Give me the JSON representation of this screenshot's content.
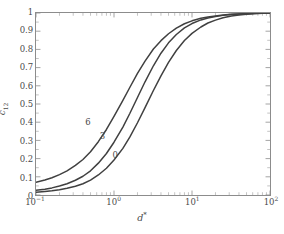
{
  "chart_data": {
    "type": "line",
    "title": "",
    "subtitle": "",
    "xlabel": "d*",
    "ylabel": "c12",
    "xscale": "log",
    "yscale": "linear",
    "xlim": [
      0.1,
      100
    ],
    "ylim": [
      0,
      1
    ],
    "grid": false,
    "legend_position": "inline-curve-labels",
    "xticks": [
      "10⁻¹",
      "10⁰",
      "10¹",
      "10²"
    ],
    "xtick_values": [
      0.1,
      1,
      10,
      100
    ],
    "ytick_values": [
      0,
      0.1,
      0.2,
      0.3,
      0.4,
      0.5,
      0.6,
      0.7,
      0.8,
      0.9,
      1
    ],
    "yticks": [
      "0",
      "0.1",
      "0.2",
      "0.3",
      "0.4",
      "0.5",
      "0.6",
      "0.7",
      "0.8",
      "0.9",
      "1"
    ],
    "line_color": "#404040",
    "axis_color": "#8c8c8c",
    "text_color": "#4a4a4a",
    "x": [
      0.1,
      0.13,
      0.16,
      0.2,
      0.25,
      0.32,
      0.4,
      0.5,
      0.63,
      0.8,
      1.0,
      1.3,
      1.6,
      2.0,
      2.5,
      3.2,
      4.0,
      5.0,
      6.3,
      8.0,
      10.0,
      13.0,
      16.0,
      20.0,
      25.0,
      32.0,
      40.0,
      50.0,
      63.0,
      80.0,
      100.0
    ],
    "series": [
      {
        "name": "6",
        "label": "6",
        "label_x": 0.47,
        "label_y": 0.4,
        "values": [
          0.07,
          0.082,
          0.095,
          0.112,
          0.133,
          0.163,
          0.195,
          0.238,
          0.293,
          0.36,
          0.432,
          0.52,
          0.592,
          0.668,
          0.736,
          0.802,
          0.848,
          0.886,
          0.917,
          0.941,
          0.957,
          0.971,
          0.978,
          0.984,
          0.989,
          0.993,
          0.995,
          0.997,
          0.998,
          0.999,
          1.0
        ]
      },
      {
        "name": "3",
        "label": "3",
        "label_x": 0.72,
        "label_y": 0.325,
        "values": [
          0.026,
          0.032,
          0.039,
          0.049,
          0.062,
          0.081,
          0.103,
          0.133,
          0.175,
          0.228,
          0.29,
          0.373,
          0.449,
          0.536,
          0.622,
          0.71,
          0.779,
          0.836,
          0.882,
          0.918,
          0.942,
          0.962,
          0.973,
          0.981,
          0.987,
          0.992,
          0.994,
          0.996,
          0.998,
          0.999,
          1.0
        ]
      },
      {
        "name": "0",
        "label": "0",
        "label_x": 1.05,
        "label_y": 0.225,
        "values": [
          0.015,
          0.019,
          0.023,
          0.029,
          0.037,
          0.048,
          0.062,
          0.082,
          0.11,
          0.147,
          0.192,
          0.256,
          0.319,
          0.397,
          0.48,
          0.574,
          0.655,
          0.729,
          0.794,
          0.849,
          0.888,
          0.923,
          0.945,
          0.961,
          0.974,
          0.984,
          0.989,
          0.993,
          0.996,
          0.998,
          1.0
        ]
      }
    ]
  }
}
